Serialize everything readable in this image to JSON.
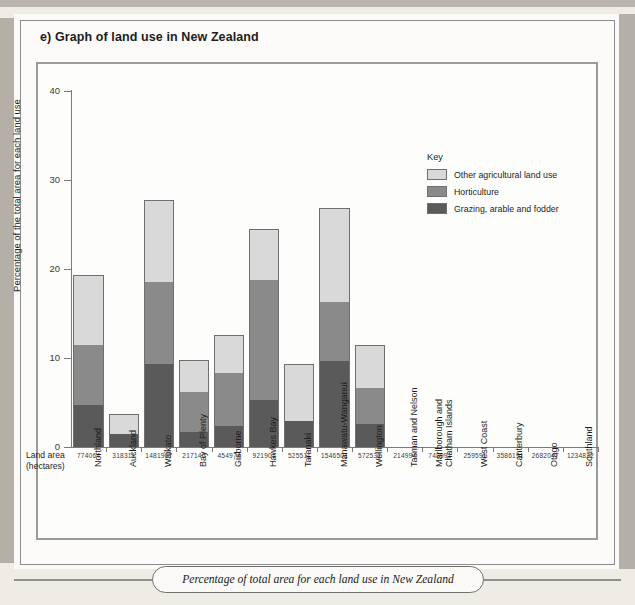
{
  "title": "e) Graph of land use in New Zealand",
  "caption": "Percentage of total area for each land use in New Zealand",
  "land_area_caption_line1": "Land area",
  "land_area_caption_line2": "(hectares)",
  "key": {
    "title": "Key",
    "items": [
      {
        "label": "Other agricultural land use",
        "color": "#d9d9d9"
      },
      {
        "label": "Horticulture",
        "color": "#8a8a8a"
      },
      {
        "label": "Grazing, arable and fodder",
        "color": "#5a5a5a"
      }
    ]
  },
  "chart_data": {
    "type": "bar",
    "stacked": true,
    "title": "e) Graph of land use in New Zealand",
    "xlabel": "",
    "ylabel": "Percentage of the total area for each land use",
    "ylim": [
      0,
      40
    ],
    "yticks": [
      0,
      10,
      20,
      30,
      40
    ],
    "grid": false,
    "legend_position": "right",
    "categories": [
      "Northland",
      "Auckland",
      "Waikato",
      "Bay of Plenty",
      "Gisborne",
      "Hawkes Bay",
      "Taranaki",
      "Manawatu-Wanganui",
      "Wellington",
      "Tasman and Nelson",
      "Marlborough and Chatham Islands",
      "West Coast",
      "Canterbury",
      "Otago",
      "Southland"
    ],
    "land_area_hectares": [
      "774064",
      "318311",
      "1481967",
      "217140",
      "454974",
      "921901",
      "525511",
      "1546501",
      "572532",
      "214994",
      "748991",
      "259591",
      "3586191",
      "2682047",
      "1234822"
    ],
    "series": [
      {
        "name": "Grazing, arable and fodder",
        "color": "#5a5a5a",
        "values": [
          4.7,
          1.5,
          9.4,
          1.7,
          2.4,
          5.3,
          2.9,
          9.7,
          2.6,
          0,
          0,
          0,
          0,
          0,
          0
        ]
      },
      {
        "name": "Horticulture",
        "color": "#8a8a8a",
        "values": [
          6.8,
          0.0,
          9.2,
          4.6,
          6.0,
          13.5,
          0.0,
          6.7,
          4.1,
          0,
          0,
          0,
          0,
          0,
          0
        ]
      },
      {
        "name": "Other agricultural land use",
        "color": "#d9d9d9",
        "values": [
          7.8,
          2.2,
          9.2,
          3.5,
          4.2,
          5.7,
          6.4,
          10.5,
          4.8,
          0,
          0,
          0,
          0,
          0,
          0
        ]
      }
    ],
    "totals": [
      19.3,
      3.7,
      27.8,
      9.8,
      12.6,
      24.5,
      9.3,
      26.9,
      11.5,
      0,
      0,
      0,
      0,
      0,
      0
    ]
  }
}
